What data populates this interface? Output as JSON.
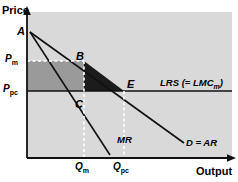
{
  "figure": {
    "type": "economics-diagram",
    "title_visible": false,
    "background": "#ffffff",
    "plot_background": "#d9d9d9",
    "axes": {
      "y_title": "Price",
      "x_title": "Output"
    },
    "colors": {
      "plot_bg": "#d9d9d9",
      "rect_fill": "#9a9a9a",
      "triangle_fill": "#1c1c1c",
      "line": "#111111",
      "dashed_white": "#ffffff"
    },
    "points": [
      {
        "id": "A",
        "label": "A",
        "x": 30,
        "y": 32,
        "label_x": 17,
        "label_y": 26
      },
      {
        "id": "B",
        "label": "B",
        "x": 84,
        "y": 61,
        "label_x": 76,
        "label_y": 52
      },
      {
        "id": "C",
        "label": "C",
        "x": 84,
        "y": 97,
        "label_x": 75,
        "label_y": 100
      },
      {
        "id": "E",
        "label": "E",
        "x": 124,
        "y": 91,
        "label_x": 126,
        "label_y": 80
      }
    ],
    "y_ticks": [
      {
        "label": "P",
        "sub": "m",
        "value_y": 61,
        "label_x": 5,
        "label_y": 55
      },
      {
        "label": "P",
        "sub": "pc",
        "value_y": 91,
        "label_x": 5,
        "label_y": 85
      }
    ],
    "x_ticks": [
      {
        "label": "Q",
        "sub": "m",
        "value_x": 84,
        "label_x": 74,
        "label_y": 163
      },
      {
        "label": "Q",
        "sub": "pc",
        "value_x": 124,
        "label_x": 112,
        "label_y": 163
      }
    ],
    "curves": [
      {
        "id": "demand",
        "label": "D = AR",
        "label_x": 186,
        "label_y": 143,
        "from": {
          "x": 30,
          "y": 32
        },
        "to": {
          "x": 184,
          "y": 143
        }
      },
      {
        "id": "marginal-revenue",
        "label": "MR",
        "label_x": 117,
        "label_y": 140,
        "from": {
          "x": 30,
          "y": 32
        },
        "to": {
          "x": 110,
          "y": 155
        }
      },
      {
        "id": "long-run-supply",
        "label": "LRS (= LMC",
        "label_sub": "m",
        "label_tail": ")",
        "label_x": 160,
        "label_y": 83,
        "from": {
          "x": 27,
          "y": 91
        },
        "to": {
          "x": 232,
          "y": 91
        }
      }
    ],
    "shaded_regions": [
      {
        "id": "monopoly-profit-rectangle",
        "fill": "#9a9a9a",
        "description": "P_m P_pc C B rectangle"
      },
      {
        "id": "deadweight-loss-triangle",
        "fill": "#1c1c1c",
        "description": "B C E triangle"
      }
    ]
  }
}
